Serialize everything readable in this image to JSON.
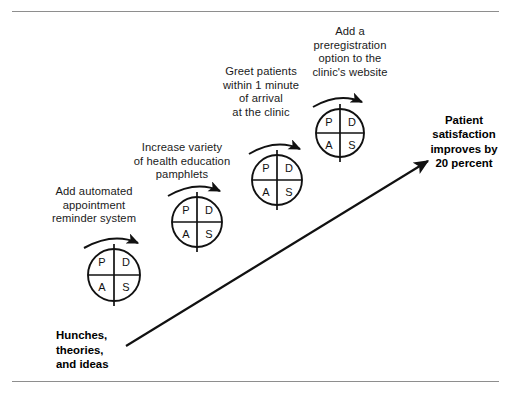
{
  "figure": {
    "background_color": "#ffffff",
    "rule_color": "#8e8e8e",
    "ink_color": "#111111",
    "origin_label": "Hunches,\ntheories,\nand ideas",
    "outcome_label": "Patient\nsatisfaction\nimproves by\n20 percent"
  },
  "cycles": [
    {
      "index": 1,
      "caption": "Add automated\nappointment\nreminder system",
      "wheel": {
        "top_left": "P",
        "top_right": "D",
        "bottom_left": "A",
        "bottom_right": "S"
      }
    },
    {
      "index": 2,
      "caption": "Increase variety\nof health education\npamphlets",
      "wheel": {
        "top_left": "P",
        "top_right": "D",
        "bottom_left": "A",
        "bottom_right": "S"
      }
    },
    {
      "index": 3,
      "caption": "Greet patients\nwithin 1 minute\nof arrival\nat the clinic",
      "wheel": {
        "top_left": "P",
        "top_right": "D",
        "bottom_left": "A",
        "bottom_right": "S"
      }
    },
    {
      "index": 4,
      "caption": "Add a\npreregistration\noption to the\nclinic's website",
      "wheel": {
        "top_left": "P",
        "top_right": "D",
        "bottom_left": "A",
        "bottom_right": "S"
      }
    }
  ]
}
